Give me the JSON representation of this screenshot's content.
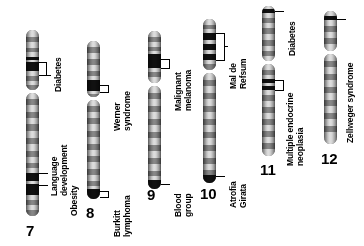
{
  "figure": {
    "type": "ideogram-diagram",
    "background_color": "#ffffff",
    "band_dark_color": "#111111",
    "band_light_color": "#e2e2e2"
  },
  "chromosomes": [
    {
      "number": "7",
      "labels": [
        {
          "text": "Diabetes",
          "id": "diabetes"
        },
        {
          "text": "Language\ndevelopment",
          "id": "language-development"
        },
        {
          "text": "Obesity",
          "id": "obesity"
        }
      ]
    },
    {
      "number": "8",
      "labels": [
        {
          "text": "Werner\nsyndrome",
          "id": "werner-syndrome"
        },
        {
          "text": "Burkitt\nlymphoma",
          "id": "burkitt-lymphoma"
        }
      ]
    },
    {
      "number": "9",
      "labels": [
        {
          "text": "Malignant\nmelanoma",
          "id": "malignant-melanoma"
        },
        {
          "text": "Blood\ngroup",
          "id": "blood-group"
        }
      ]
    },
    {
      "number": "10",
      "labels": [
        {
          "text": "Mal de\nRefsum",
          "id": "mal-de-refsum"
        },
        {
          "text": "Atrofia\nGirata",
          "id": "atrofia-girata"
        }
      ]
    },
    {
      "number": "11",
      "labels": [
        {
          "text": "Diabetes",
          "id": "diabetes"
        },
        {
          "text": "Multiple endocrine\nneoplasia",
          "id": "multiple-endocrine-neoplasia"
        }
      ]
    },
    {
      "number": "12",
      "labels": [
        {
          "text": "Zellweger syndrome",
          "id": "zellweger-syndrome"
        }
      ]
    }
  ]
}
